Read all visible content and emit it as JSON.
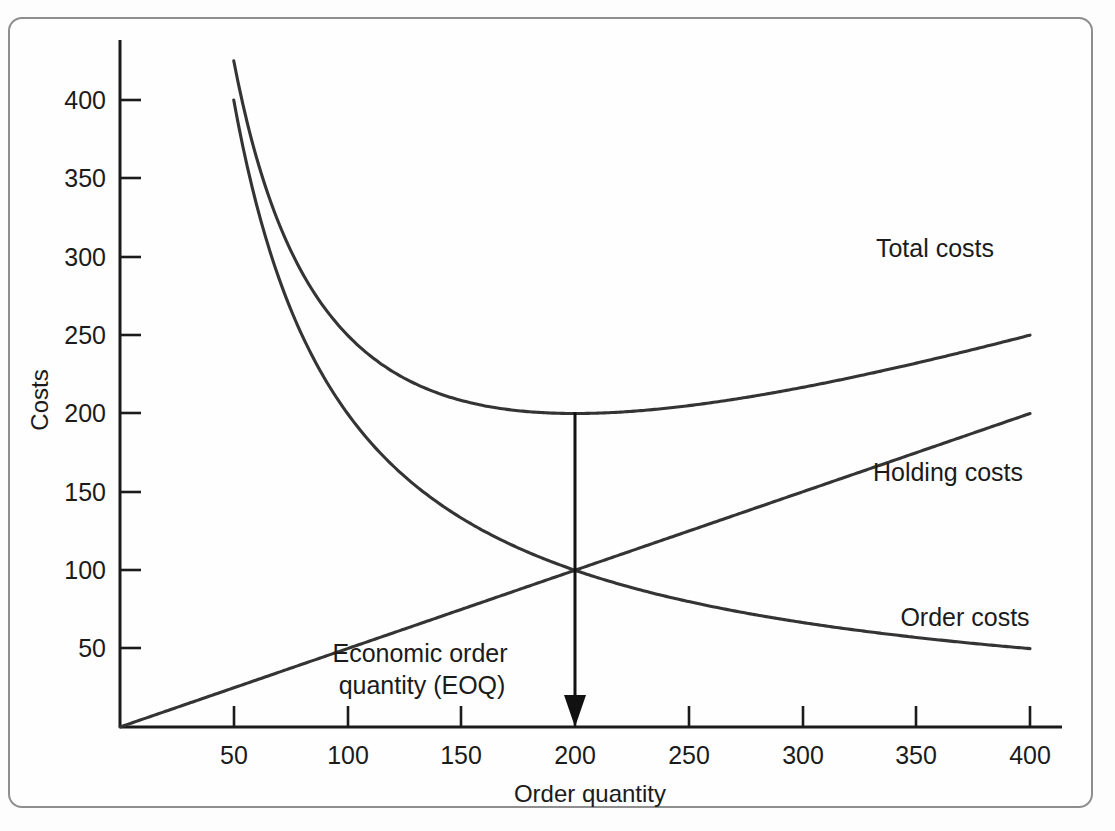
{
  "figure": {
    "caption_visible": false,
    "frame_color": "#8e8e8e",
    "background_color": "#fefefe"
  },
  "chart_data": {
    "type": "line",
    "title": "",
    "subtitle": "",
    "xlabel": "Order quantity",
    "ylabel": "Costs",
    "xlim": [
      0,
      420
    ],
    "ylim": [
      0,
      435
    ],
    "grid": false,
    "legend_position": "inline-right-of-curves",
    "x_ticks": [
      50,
      100,
      150,
      200,
      250,
      300,
      350,
      400
    ],
    "x_tick_labels": [
      "50",
      "100",
      "150",
      "200",
      "250",
      "300",
      "350",
      "400"
    ],
    "y_ticks": [
      50,
      100,
      150,
      200,
      250,
      300,
      350,
      400
    ],
    "y_tick_labels": [
      "50",
      "100",
      "150",
      "200",
      "250",
      "300",
      "350",
      "400"
    ],
    "series": [
      {
        "name": "Total costs",
        "label": "Total costs",
        "shape": "u-curve",
        "color": "#343434",
        "x": [
          50,
          75,
          100,
          125,
          150,
          175,
          200,
          225,
          250,
          275,
          300,
          325,
          350,
          375,
          400
        ],
        "y": [
          425,
          317,
          262,
          231,
          213,
          204,
          201,
          204,
          210,
          219,
          229,
          241,
          253,
          266,
          280
        ],
        "minimum": {
          "x": 200,
          "y": 200
        },
        "label_anchor": {
          "x": 360,
          "y": 250
        }
      },
      {
        "name": "Order costs",
        "label": "Order costs",
        "shape": "hyperbola",
        "color": "#343434",
        "x": [
          50,
          75,
          100,
          125,
          150,
          175,
          200,
          225,
          250,
          275,
          300,
          325,
          350,
          375,
          400
        ],
        "y": [
          400,
          267,
          200,
          160,
          133,
          114,
          100,
          89,
          80,
          73,
          67,
          62,
          57,
          53,
          50
        ],
        "label_anchor": {
          "x": 360,
          "y": 72
        }
      },
      {
        "name": "Holding costs",
        "label": "Holding costs",
        "shape": "line",
        "color": "#343434",
        "x": [
          0,
          400
        ],
        "y": [
          0,
          200
        ],
        "label_anchor": {
          "x": 360,
          "y": 152
        }
      }
    ],
    "annotations": [
      {
        "name": "eoq-annotation",
        "text_line1": "Economic order",
        "text_line2": "quantity (EOQ)",
        "arrow_from": {
          "x": 200,
          "y": 201
        },
        "arrow_to": {
          "x": 200,
          "y": 0
        },
        "marker": "down-arrow"
      }
    ],
    "intersection_point": {
      "x": 200,
      "y": 100
    }
  },
  "axes": {
    "y_axis_title": "Costs",
    "x_axis_title": "Order quantity"
  },
  "labels": {
    "total_costs": "Total costs",
    "holding_costs": "Holding costs",
    "order_costs": "Order costs",
    "eoq_line1": "Economic order",
    "eoq_line2": "quantity (EOQ)"
  },
  "y_tick_texts": [
    "400",
    "350",
    "300",
    "250",
    "200",
    "150",
    "100",
    "50"
  ],
  "x_tick_texts": [
    "50",
    "100",
    "150",
    "200",
    "250",
    "300",
    "350",
    "400"
  ]
}
